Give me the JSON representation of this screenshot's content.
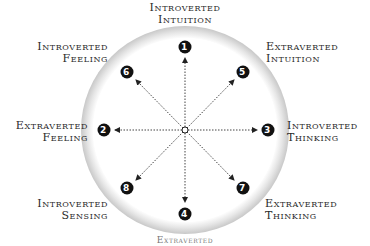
{
  "diagram": {
    "type": "circular-function-wheel",
    "center_marker": "small hollow circle",
    "nodes": [
      {
        "number": "1",
        "line1": "Introverted",
        "line2": "Intuition",
        "position": "top"
      },
      {
        "number": "2",
        "line1": "Extraverted",
        "line2": "Feeling",
        "position": "left"
      },
      {
        "number": "3",
        "line1": "Introverted",
        "line2": "Thinking",
        "position": "right"
      },
      {
        "number": "4",
        "line1": "Extraverted",
        "line2": "Sensing",
        "position": "bottom"
      },
      {
        "number": "5",
        "line1": "Extraverted",
        "line2": "Intuition",
        "position": "upper-right"
      },
      {
        "number": "6",
        "line1": "Introverted",
        "line2": "Feeling",
        "position": "upper-left"
      },
      {
        "number": "7",
        "line1": "Extraverted",
        "line2": "Thinking",
        "position": "lower-right"
      },
      {
        "number": "8",
        "line1": "Introverted",
        "line2": "Sensing",
        "position": "lower-left"
      }
    ],
    "colors": {
      "ring": "#d9d9d9",
      "badge": "#111111",
      "badge_text": "#ffffff",
      "arrow": "#333333",
      "label": "#2a2a2a"
    }
  }
}
